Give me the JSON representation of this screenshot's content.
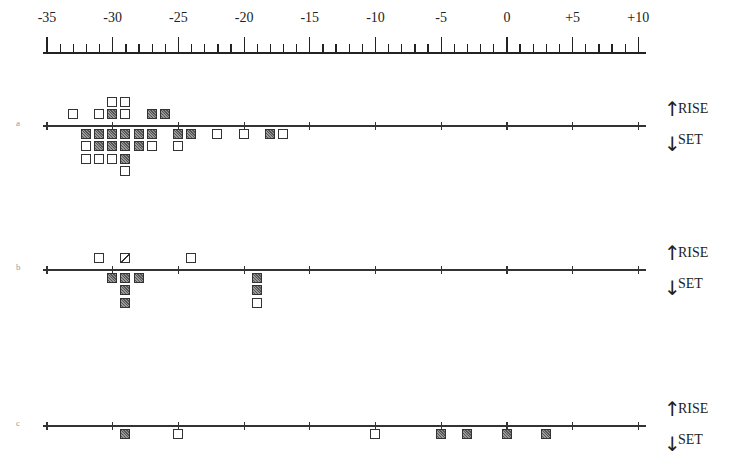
{
  "chart_data": {
    "type": "scatter",
    "title": "",
    "xlabel": "",
    "ylabel": "",
    "xlim": [
      -35,
      10
    ],
    "x_tick_labels": [
      "-35",
      "-30",
      "-25",
      "-20",
      "-15",
      "-10",
      "-5",
      "0",
      "+5",
      "+10"
    ],
    "x_ticks": [
      -35,
      -30,
      -25,
      -20,
      -15,
      -10,
      -5,
      0,
      5,
      10
    ],
    "minor_tick_step": 1,
    "grid": false,
    "direction_labels": {
      "up": "RISE",
      "down": "SET"
    },
    "legend": [
      {
        "marker": "open-square",
        "meaning": "open"
      },
      {
        "marker": "filled-square",
        "meaning": "filled (hatched)"
      },
      {
        "marker": "half-square",
        "meaning": "half (diagonal)"
      }
    ],
    "panels": [
      {
        "label": "a",
        "points": [
          {
            "x": -30,
            "level": 2,
            "type": "open"
          },
          {
            "x": -29,
            "level": 2,
            "type": "open"
          },
          {
            "x": -33,
            "level": 1,
            "type": "open"
          },
          {
            "x": -31,
            "level": 1,
            "type": "open"
          },
          {
            "x": -30,
            "level": 1,
            "type": "filled"
          },
          {
            "x": -29,
            "level": 1,
            "type": "open"
          },
          {
            "x": -27,
            "level": 1,
            "type": "filled"
          },
          {
            "x": -26,
            "level": 1,
            "type": "filled"
          },
          {
            "x": -32,
            "level": -1,
            "type": "filled"
          },
          {
            "x": -31,
            "level": -1,
            "type": "filled"
          },
          {
            "x": -30,
            "level": -1,
            "type": "filled"
          },
          {
            "x": -29,
            "level": -1,
            "type": "filled"
          },
          {
            "x": -28,
            "level": -1,
            "type": "filled"
          },
          {
            "x": -27,
            "level": -1,
            "type": "filled"
          },
          {
            "x": -25,
            "level": -1,
            "type": "filled"
          },
          {
            "x": -24,
            "level": -1,
            "type": "filled"
          },
          {
            "x": -22,
            "level": -1,
            "type": "open"
          },
          {
            "x": -20,
            "level": -1,
            "type": "open"
          },
          {
            "x": -18,
            "level": -1,
            "type": "filled"
          },
          {
            "x": -17,
            "level": -1,
            "type": "open"
          },
          {
            "x": -32,
            "level": -2,
            "type": "open"
          },
          {
            "x": -31,
            "level": -2,
            "type": "filled"
          },
          {
            "x": -30,
            "level": -2,
            "type": "filled"
          },
          {
            "x": -29,
            "level": -2,
            "type": "filled"
          },
          {
            "x": -28,
            "level": -2,
            "type": "filled"
          },
          {
            "x": -27,
            "level": -2,
            "type": "open"
          },
          {
            "x": -25,
            "level": -2,
            "type": "open"
          },
          {
            "x": -32,
            "level": -3,
            "type": "open"
          },
          {
            "x": -31,
            "level": -3,
            "type": "open"
          },
          {
            "x": -30,
            "level": -3,
            "type": "open"
          },
          {
            "x": -29,
            "level": -3,
            "type": "filled"
          },
          {
            "x": -29,
            "level": -4,
            "type": "open"
          }
        ]
      },
      {
        "label": "b",
        "points": [
          {
            "x": -31,
            "level": 1,
            "type": "open"
          },
          {
            "x": -29,
            "level": 1,
            "type": "half"
          },
          {
            "x": -24,
            "level": 1,
            "type": "open"
          },
          {
            "x": -30,
            "level": -1,
            "type": "filled"
          },
          {
            "x": -29,
            "level": -1,
            "type": "filled"
          },
          {
            "x": -28,
            "level": -1,
            "type": "filled"
          },
          {
            "x": -29,
            "level": -2,
            "type": "filled"
          },
          {
            "x": -29,
            "level": -3,
            "type": "filled"
          },
          {
            "x": -19,
            "level": -1,
            "type": "filled"
          },
          {
            "x": -19,
            "level": -2,
            "type": "filled"
          },
          {
            "x": -19,
            "level": -3,
            "type": "open"
          }
        ]
      },
      {
        "label": "c",
        "points": [
          {
            "x": -29,
            "level": -1,
            "type": "filled"
          },
          {
            "x": -25,
            "level": -1,
            "type": "open"
          },
          {
            "x": -10,
            "level": -1,
            "type": "open"
          },
          {
            "x": -5,
            "level": -1,
            "type": "filled"
          },
          {
            "x": -3,
            "level": -1,
            "type": "filled"
          },
          {
            "x": 0,
            "level": -1,
            "type": "filled"
          },
          {
            "x": 3,
            "level": -1,
            "type": "filled"
          }
        ]
      }
    ]
  },
  "axis": {
    "labels": [
      "-35",
      "-30",
      "-25",
      "-20",
      "-15",
      "-10",
      "-5",
      "0",
      "+5",
      "+10"
    ]
  },
  "panels": [
    {
      "label": "a",
      "rise": "RISE",
      "set": "SET"
    },
    {
      "label": "b",
      "rise": "RISE",
      "set": "SET"
    },
    {
      "label": "c",
      "rise": "RISE",
      "set": "SET"
    }
  ],
  "icons": {
    "up": "arrow-up-icon",
    "down": "arrow-down-icon"
  }
}
